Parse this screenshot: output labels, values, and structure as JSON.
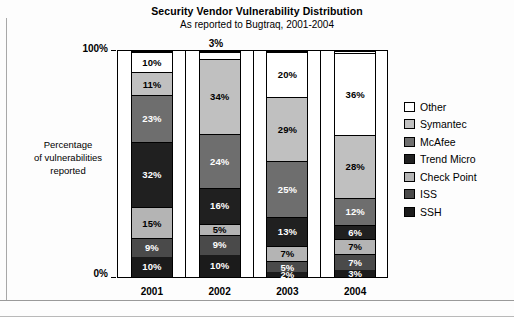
{
  "chart_data": {
    "type": "bar",
    "subtype": "stacked-percent-column",
    "title": "Security Vendor Vulnerability Distribution",
    "subtitle": "As reported to Bugtraq, 2001-2004",
    "xlabel": "",
    "ylabel": "Percentage of vulnerabilities reported",
    "ylabel_lines": [
      "Percentage",
      "of vulnerabilities",
      "reported"
    ],
    "categories": [
      "2001",
      "2002",
      "2003",
      "2004"
    ],
    "ylim": [
      0,
      100
    ],
    "ytick_labels": [
      "0%",
      "100%"
    ],
    "ytick_values": [
      0,
      100
    ],
    "grid": false,
    "legend_position": "right",
    "stack_order_bottom_to_top": [
      "SSH",
      "ISS",
      "Check Point",
      "Trend Micro",
      "McAfee",
      "Symantec",
      "Other"
    ],
    "series": [
      {
        "name": "SSH",
        "color": "#1b1b1b",
        "label_color": "light",
        "values": [
          10,
          10,
          2,
          3
        ]
      },
      {
        "name": "ISS",
        "color": "#4a4a4a",
        "label_color": "light",
        "values": [
          9,
          9,
          5,
          7
        ]
      },
      {
        "name": "Check Point",
        "color": "#b4b4b4",
        "label_color": "dark",
        "values": [
          15,
          5,
          7,
          7
        ]
      },
      {
        "name": "Trend Micro",
        "color": "#202020",
        "label_color": "light",
        "values": [
          32,
          16,
          13,
          6
        ]
      },
      {
        "name": "McAfee",
        "color": "#6e6e6e",
        "label_color": "light",
        "values": [
          23,
          24,
          25,
          12
        ]
      },
      {
        "name": "Symantec",
        "color": "#c0c0c0",
        "label_color": "dark",
        "values": [
          11,
          34,
          29,
          28
        ]
      },
      {
        "name": "Other",
        "color": "#ffffff",
        "label_color": "dark",
        "values": [
          10,
          3,
          20,
          36
        ]
      }
    ],
    "data_labels": {
      "2001": {
        "SSH": "10%",
        "ISS": "9%",
        "Check Point": "15%",
        "Trend Micro": "32%",
        "McAfee": "23%",
        "Symantec": "11%",
        "Other": "10%"
      },
      "2002": {
        "SSH": "10%",
        "ISS": "9%",
        "Check Point": "5%",
        "Trend Micro": "16%",
        "McAfee": "24%",
        "Symantec": "34%",
        "Other": "3%"
      },
      "2003": {
        "SSH": "2%",
        "ISS": "5%",
        "Check Point": "7%",
        "Trend Micro": "13%",
        "McAfee": "25%",
        "Symantec": "29%",
        "Other": "20%"
      },
      "2004": {
        "SSH": "3%",
        "ISS": "7%",
        "Check Point": "7%",
        "Trend Micro": "6%",
        "McAfee": "12%",
        "Symantec": "28%",
        "Other": "36%"
      }
    },
    "external_labels": [
      {
        "category": "2002",
        "series": "Other",
        "text": "3%"
      }
    ]
  },
  "legend": {
    "items": [
      {
        "label": "Other",
        "color": "#ffffff"
      },
      {
        "label": "Symantec",
        "color": "#c0c0c0"
      },
      {
        "label": "McAfee",
        "color": "#6e6e6e"
      },
      {
        "label": "Trend Micro",
        "color": "#202020"
      },
      {
        "label": "Check Point",
        "color": "#b4b4b4"
      },
      {
        "label": "ISS",
        "color": "#4a4a4a"
      },
      {
        "label": "SSH",
        "color": "#1b1b1b"
      }
    ]
  },
  "axis": {
    "y_top": "100%",
    "y_bottom": "0%"
  }
}
